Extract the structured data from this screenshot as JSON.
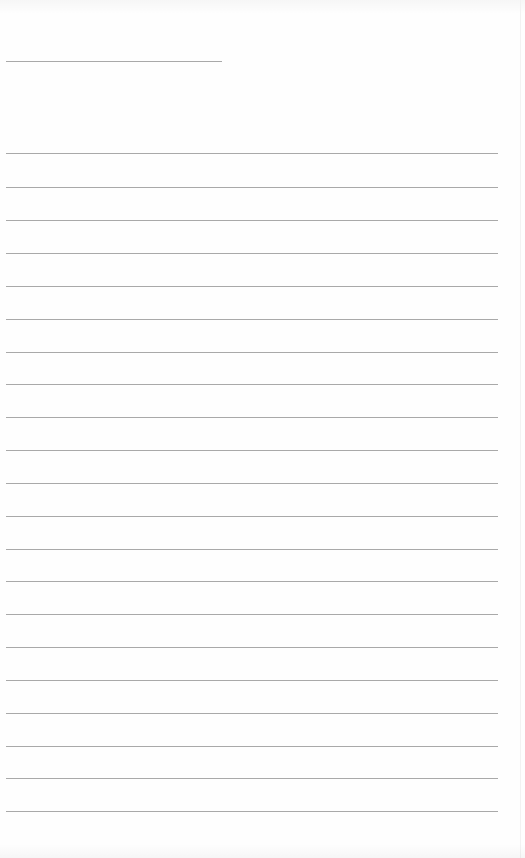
{
  "sheet": {
    "type": "lined-paper",
    "background_color": "#fefefe",
    "line_color": "#a9a9a9",
    "header_line": {
      "x": 6,
      "y": 61,
      "width": 216
    },
    "ruled_lines": {
      "count": 21,
      "x": 6,
      "width": 492,
      "y_positions": [
        153,
        187,
        220,
        253,
        286,
        319,
        352,
        384,
        417,
        450,
        483,
        516,
        549,
        581,
        614,
        647,
        680,
        713,
        746,
        778,
        811
      ]
    }
  }
}
